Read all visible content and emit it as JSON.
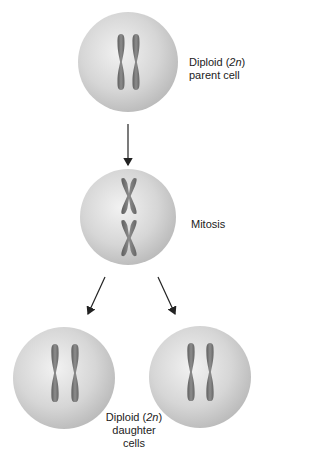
{
  "figure": {
    "labels": {
      "parent": {
        "line1_prefix": "Diploid (",
        "line1_italic": "2n",
        "line1_suffix": ")",
        "line2": "parent cell"
      },
      "mitosis": "Mitosis",
      "daughters": {
        "line1_prefix": "Diploid (",
        "line1_italic": "2n",
        "line1_suffix": ")",
        "line2": "daughter cells"
      }
    },
    "colors": {
      "cell": "#d9d9d9",
      "chromosome": "#7a7a7a",
      "arrow": "#222222"
    }
  }
}
